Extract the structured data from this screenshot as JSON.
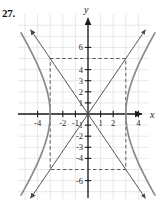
{
  "problem": {
    "number": "27."
  },
  "axes": {
    "x_label": "x",
    "y_label": "y",
    "x_ticks": [
      {
        "value": -4,
        "label": "-4"
      },
      {
        "value": -2,
        "label": "-2"
      },
      {
        "value": -1,
        "label": "-1"
      },
      {
        "value": 1,
        "label": "1"
      },
      {
        "value": 2,
        "label": "2"
      },
      {
        "value": 4,
        "label": "4"
      }
    ],
    "y_ticks": [
      {
        "value": 6,
        "label": "6"
      },
      {
        "value": 4,
        "label": "4"
      },
      {
        "value": 3,
        "label": "3"
      },
      {
        "value": 2,
        "label": "2"
      },
      {
        "value": 1,
        "label": "1"
      },
      {
        "value": -1,
        "label": "-1"
      },
      {
        "value": -2,
        "label": "-2"
      },
      {
        "value": -3,
        "label": "-3"
      },
      {
        "value": -4,
        "label": "-4"
      },
      {
        "value": -6,
        "label": "-6"
      }
    ]
  },
  "chart_data": {
    "type": "line",
    "title": "",
    "xlabel": "x",
    "ylabel": "y",
    "xlim": [
      -5.6,
      5.6
    ],
    "ylim": [
      -7.6,
      7.6
    ],
    "grid": true,
    "grid_color": "#d8d8d8",
    "axis_color": "#1a1a1a",
    "curve_color": "#8a8a8a",
    "dashed_color": "#4a4a4a",
    "curve_equation": "x^2/9 - y^2/25 = 1",
    "center": [
      0,
      0
    ],
    "vertices": [
      [
        -3,
        0
      ],
      [
        3,
        0
      ]
    ],
    "a": 3,
    "b": 5,
    "asymptotes": [
      {
        "name": "y = (5/3)x",
        "slope": 1.6667
      },
      {
        "name": "y = -(5/3)x",
        "slope": -1.6667
      }
    ],
    "central_rectangle": {
      "x_range": [
        -3,
        3
      ],
      "y_range": [
        -5,
        5
      ],
      "corners": [
        [
          -3,
          5
        ],
        [
          3,
          5
        ],
        [
          3,
          -5
        ],
        [
          -3,
          -5
        ]
      ]
    },
    "series": [
      {
        "name": "right branch",
        "points": [
          [
            3,
            0
          ],
          [
            3.04,
            1
          ],
          [
            3.16,
            2
          ],
          [
            3.35,
            3
          ],
          [
            3.6,
            4
          ],
          [
            3.9,
            5
          ],
          [
            4.24,
            6
          ],
          [
            4.6,
            7
          ],
          [
            4.86,
            7.6
          ]
        ]
      },
      {
        "name": "left branch",
        "points": [
          [
            -3,
            0
          ],
          [
            -3.04,
            1
          ],
          [
            -3.16,
            2
          ],
          [
            -3.35,
            3
          ],
          [
            -3.6,
            4
          ],
          [
            -3.9,
            5
          ],
          [
            -4.24,
            6
          ],
          [
            -4.6,
            7
          ],
          [
            -4.86,
            7.6
          ]
        ]
      }
    ]
  }
}
